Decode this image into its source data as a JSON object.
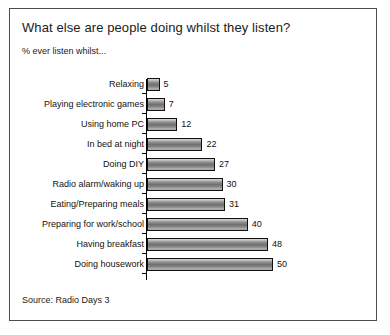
{
  "chart": {
    "title": "What else are people doing whilst they listen?",
    "subtitle": "% ever listen whilst...",
    "source": "Source: Radio Days 3"
  },
  "chart_data": {
    "type": "bar",
    "orientation": "horizontal",
    "title": "What else are people doing whilst they listen?",
    "subtitle": "% ever listen whilst...",
    "xlabel": "",
    "ylabel": "",
    "xlim": [
      0,
      52
    ],
    "grid": false,
    "legend": null,
    "data_labels": true,
    "source": "Source: Radio Days 3",
    "categories": [
      "Relaxing",
      "Playing electronic games",
      "Using home PC",
      "In bed at night",
      "Doing DIY",
      "Radio alarm/waking up",
      "Eating/Preparing meals",
      "Preparing for work/school",
      "Having breakfast",
      "Doing housework"
    ],
    "values": [
      5,
      7,
      12,
      22,
      27,
      30,
      31,
      40,
      48,
      50
    ]
  }
}
